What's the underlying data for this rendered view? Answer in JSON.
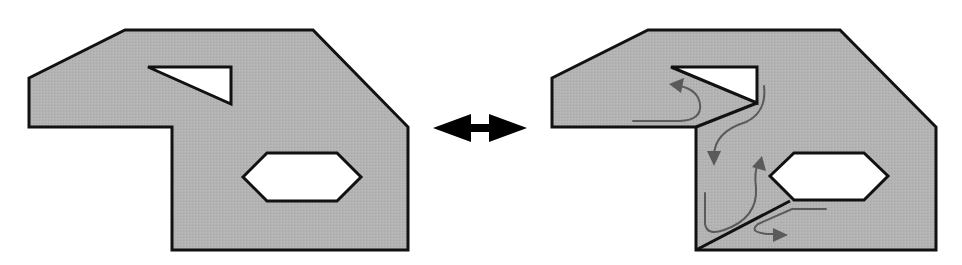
{
  "diagram": {
    "colors": {
      "fill": "#b4b4b4",
      "stroke": "#111111",
      "hole": "#ffffff",
      "flow_arrow": "#5a5a5a",
      "double_arrow": "#000000"
    },
    "left_shape": {
      "label": "intact plate",
      "outline": "29,78 125,30 313,30 408,127 408,250 172,250 172,127 29,127",
      "triangle_hole": "148,67 231,67 231,104",
      "hexagon_hole": "243,177 267,153 337,153 361,177 337,201 267,201"
    },
    "right_shape": {
      "label": "cracked plate with flow",
      "outline": "552,78 648,30 840,30 936,127 936,250 696,250 696,127 552,127",
      "triangle_hole": "671,67 757,67 757,103",
      "hexagon_hole": "770,176 794,153 864,153 888,176 864,200 794,200",
      "cracks": [
        {
          "x1": 757,
          "y1": 103,
          "x2": 696,
          "y2": 127
        },
        {
          "x1": 696,
          "y1": 250,
          "x2": 790,
          "y2": 201
        }
      ],
      "flow_paths": [
        {
          "d": "M633,121 L680,121 Q700,120 700,106 Q700,92 676,84",
          "arrow_at": "676,84"
        },
        {
          "d": "M764,86 Q766,112 746,122 Q712,130 712,158",
          "arrow_at": "712,162"
        },
        {
          "d": "M705,193 L705,224 Q706,235 722,230 Q757,219 756,186 Q753,170 762,160",
          "arrow_at": "762,158"
        },
        {
          "d": "M826,209 L790,209 L754,226 Q746,234 772,234",
          "arrow_at": "784,234"
        }
      ]
    },
    "connector": {
      "type": "double-headed-arrow",
      "x1": 433,
      "x2": 527,
      "y": 128
    }
  }
}
